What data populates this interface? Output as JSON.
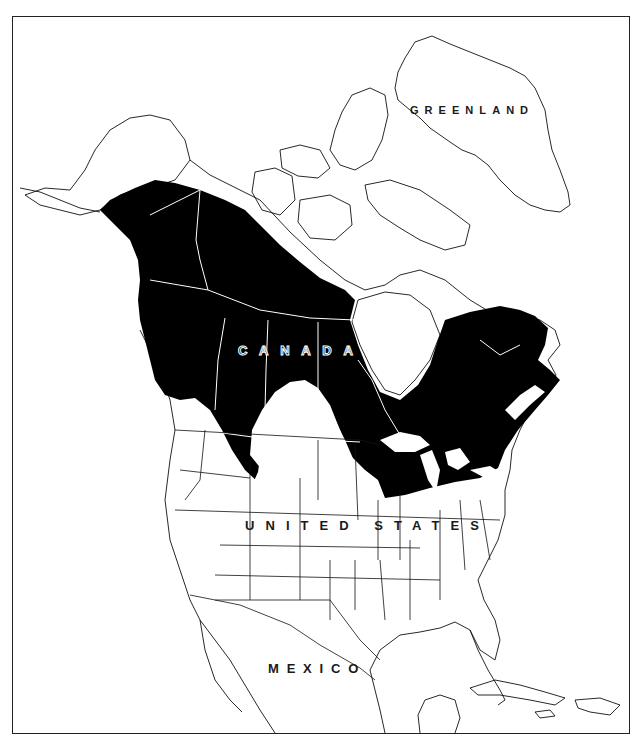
{
  "map": {
    "type": "species range map",
    "region": "North America",
    "frame": {
      "border_color": "#222222",
      "background": "#ffffff"
    },
    "range_fill_color": "#000000",
    "boundary_line_color": "#000000",
    "labels": {
      "greenland": "GREENLAND",
      "canada": "CANADA",
      "united_states": "UNITED STATES",
      "mexico": "MEXICO"
    },
    "range_description": "Shaded range spans Alaska, Yukon, Northwest Territories, British Columbia, the Prairie Provinces, northern Ontario and Quebec, the Maritimes, and into the northern Great Lakes and northern New England states; a southward lobe extends into Montana/Idaho; the southern prairies remain unshaded."
  }
}
